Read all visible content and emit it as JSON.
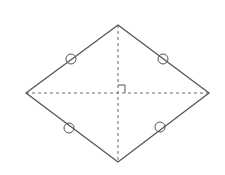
{
  "diagram": {
    "type": "rhombus",
    "vertices": {
      "top": [
        118,
        25
      ],
      "left": [
        26,
        93
      ],
      "right": [
        209,
        93
      ],
      "bottom": [
        118,
        162
      ]
    },
    "center": [
      118,
      93
    ],
    "side_markers": [
      {
        "side": "top-left",
        "cx": 71,
        "cy": 59
      },
      {
        "side": "top-right",
        "cx": 163,
        "cy": 59
      },
      {
        "side": "bottom-left",
        "cx": 69,
        "cy": 128
      },
      {
        "side": "bottom-right",
        "cx": 160,
        "cy": 127
      }
    ],
    "marker_radius": 5,
    "right_angle_marker": true,
    "colors": {
      "stroke": "#555555",
      "background": "#ffffff"
    }
  }
}
